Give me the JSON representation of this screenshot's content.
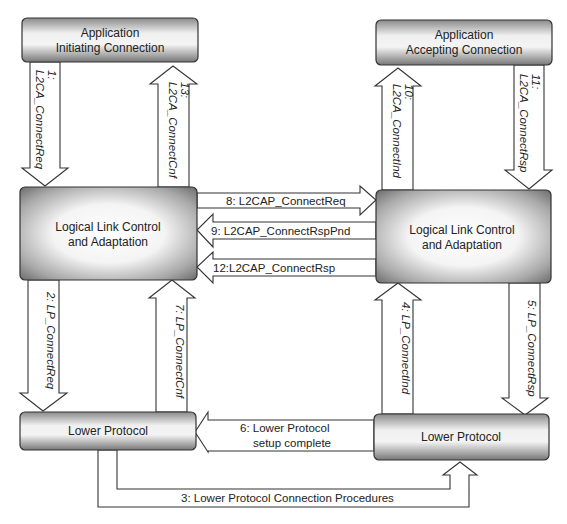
{
  "diagram": {
    "boxes": {
      "app_initiating": {
        "line1": "Application",
        "line2": "Initiating Connection"
      },
      "app_accepting": {
        "line1": "Application",
        "line2": "Accepting Connection"
      },
      "llc_left": {
        "line1": "Logical Link Control",
        "line2": "and Adaptation"
      },
      "llc_right": {
        "line1": "Logical Link Control",
        "line2": "and Adaptation"
      },
      "lower_left": {
        "label": "Lower Protocol"
      },
      "lower_right": {
        "label": "Lower Protocol"
      }
    },
    "arrows": {
      "a1": {
        "num": "1:",
        "label": "L2CA_ConnectReq"
      },
      "a2": {
        "label": "2: LP_ConnectReq"
      },
      "a3": {
        "label": "3: Lower Protocol Connection Procedures"
      },
      "a4": {
        "label": "4: LP_ConnectInd"
      },
      "a5": {
        "label": "5: LP_ConnectRsp"
      },
      "a6": {
        "line1": "6: Lower Protocol",
        "line2": "setup complete"
      },
      "a7": {
        "label": "7: LP_ConnectCnf"
      },
      "a8": {
        "label": "8: L2CAP_ConnectReq"
      },
      "a9": {
        "label": "9: L2CAP_ConnectRspPnd"
      },
      "a10": {
        "num": "10:",
        "label": "L2CA_ConnectInd"
      },
      "a11": {
        "num": "11:",
        "label": "L2CA_ConnectRsp"
      },
      "a12": {
        "label": "12:L2CAP_ConnectRsp"
      },
      "a13": {
        "num": "13:",
        "label": "L2CA_ConnectCnf"
      }
    },
    "colors": {
      "box_edge": "#6e6e6e",
      "box_center": "#ffffff",
      "stroke": "#333333",
      "background": "#ffffff"
    }
  }
}
